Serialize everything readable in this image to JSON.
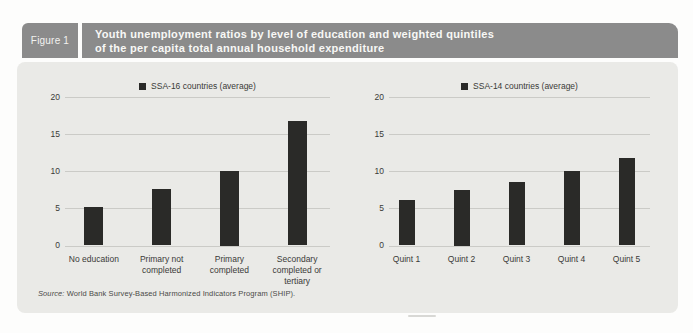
{
  "figure": {
    "label": "Figure 1",
    "title_line1": "Youth unemployment ratios by level of education and weighted quintiles",
    "title_line2": "of the per capita total annual household expenditure"
  },
  "source": {
    "prefix": "Source:",
    "text": " World Bank Survey-Based Harmonized Indicators Program (SHIP)."
  },
  "colors": {
    "header_bg": "#8b8b8b",
    "panel_bg": "#eaeae7",
    "bar": "#2a2a28",
    "grid": "#cbcbc7",
    "text": "#3a3a38",
    "title_text": "#f8f8f6"
  },
  "chart_data": [
    {
      "type": "bar",
      "legend": "SSA-16 countries (average)",
      "categories": [
        "No education",
        "Primary not\ncompleted",
        "Primary\ncompleted",
        "Secondary\ncompleted or\ntertiary"
      ],
      "values": [
        5.2,
        7.6,
        10.0,
        16.8
      ],
      "ylim": [
        0,
        20
      ],
      "yticks": [
        0,
        5,
        10,
        15,
        20
      ],
      "grid": true,
      "legend_position": "top-center",
      "bar_color": "#2a2a28",
      "xlabel": "",
      "ylabel": ""
    },
    {
      "type": "bar",
      "legend": "SSA-14 countries (average)",
      "categories": [
        "Quint 1",
        "Quint 2",
        "Quint 3",
        "Quint 4",
        "Quint 5"
      ],
      "values": [
        6.1,
        7.5,
        8.5,
        10.1,
        11.8
      ],
      "ylim": [
        0,
        20
      ],
      "yticks": [
        0,
        5,
        10,
        15,
        20
      ],
      "grid": true,
      "legend_position": "top-center",
      "bar_color": "#2a2a28",
      "xlabel": "",
      "ylabel": ""
    }
  ]
}
